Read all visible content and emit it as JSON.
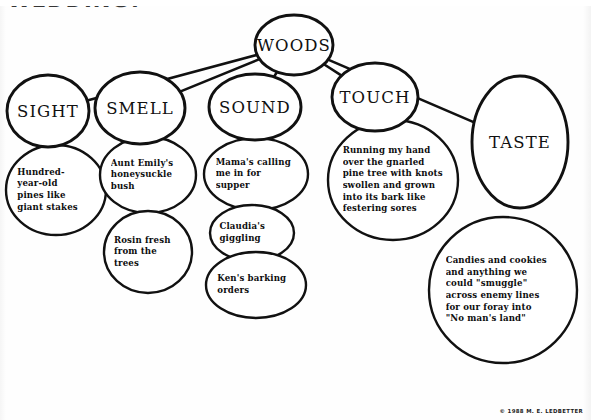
{
  "page": {
    "headline": "WEDDING?",
    "copyright": "© 1988 M. E. LEDBETTER",
    "ink_color": "#111111",
    "paper_color": "#ffffff"
  },
  "chart_data": {
    "type": "diagram",
    "subtype": "bubble-map",
    "title": "WOODS",
    "center": {
      "label": "WOODS",
      "cx": 294,
      "cy": 45,
      "rx": 39,
      "ry": 30
    },
    "categories": [
      {
        "label": "SIGHT",
        "cx": 48,
        "cy": 111,
        "rx": 41,
        "ry": 36,
        "details": [
          {
            "text": "Hundred-\nyear-old\npines like\ngiant stakes",
            "cx": 56,
            "cy": 190,
            "rx": 50,
            "ry": 45
          }
        ]
      },
      {
        "label": "SMELL",
        "cx": 140,
        "cy": 108,
        "rx": 45,
        "ry": 36,
        "details": [
          {
            "text": "Aunt Emily's\nhoneysuckle\nbush",
            "cx": 148,
            "cy": 175,
            "rx": 48,
            "ry": 38
          },
          {
            "text": "Rosin fresh\nfrom the\ntrees",
            "cx": 148,
            "cy": 252,
            "rx": 44,
            "ry": 41
          }
        ]
      },
      {
        "label": "SOUND",
        "cx": 255,
        "cy": 107,
        "rx": 46,
        "ry": 33,
        "details": [
          {
            "text": "Mama's calling\nme in for supper",
            "cx": 256,
            "cy": 174,
            "rx": 52,
            "ry": 36
          },
          {
            "text": "Claudia's\ngiggling",
            "cx": 252,
            "cy": 233,
            "rx": 42,
            "ry": 28
          },
          {
            "text": "Ken's barking\norders",
            "cx": 256,
            "cy": 285,
            "rx": 50,
            "ry": 33
          }
        ]
      },
      {
        "label": "TOUCH",
        "cx": 375,
        "cy": 97,
        "rx": 43,
        "ry": 34,
        "details": [
          {
            "text": "Running my hand\nover the gnarled\npine tree with knots\nswollen and grown\ninto its bark like\nfestering sores",
            "cx": 393,
            "cy": 180,
            "rx": 65,
            "ry": 60
          }
        ]
      },
      {
        "label": "TASTE",
        "cx": 520,
        "cy": 142,
        "rx": 48,
        "ry": 66,
        "details": [
          {
            "text": "Candies and cookies\nand anything we\ncould \"smuggle\"\nacross enemy lines\nfor our foray into\n\"No man's land\"",
            "cx": 503,
            "cy": 290,
            "rx": 74,
            "ry": 73
          }
        ]
      }
    ],
    "links": [
      {
        "from": "WOODS",
        "to": "SIGHT"
      },
      {
        "from": "WOODS",
        "to": "SMELL"
      },
      {
        "from": "WOODS",
        "to": "SOUND"
      },
      {
        "from": "WOODS",
        "to": "TOUCH"
      },
      {
        "from": "WOODS",
        "to": "TASTE"
      }
    ]
  }
}
